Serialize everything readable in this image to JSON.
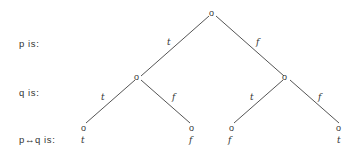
{
  "rows": {
    "p_label": "p is:",
    "q_label": "q is:",
    "pq_label": "p↔q is:"
  },
  "tree": {
    "node_glyph": "o",
    "root": "o",
    "edges": {
      "root_left": "t",
      "root_right": "f",
      "left_left": "t",
      "left_right": "f",
      "right_left": "t",
      "right_right": "f"
    },
    "leaves": [
      {
        "value": "t"
      },
      {
        "value": "f"
      },
      {
        "value": "f"
      },
      {
        "value": "t"
      }
    ]
  }
}
